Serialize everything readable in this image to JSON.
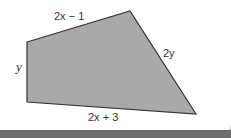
{
  "diagram": {
    "shape": "quadrilateral",
    "fill": "#a9a9a9",
    "stroke": "#333333",
    "vertices": [
      [
        27,
        42
      ],
      [
        130,
        11
      ],
      [
        196,
        114
      ],
      [
        27,
        102
      ]
    ],
    "labels": {
      "top": "2x − 1",
      "right": "2y",
      "left": "y",
      "bottom": "2x + 3"
    }
  }
}
